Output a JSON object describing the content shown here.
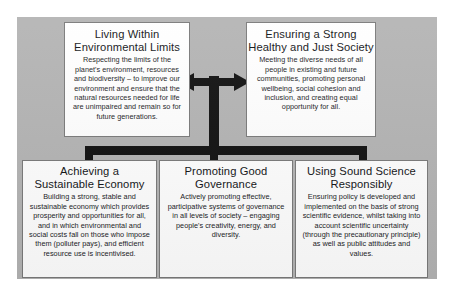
{
  "diagram": {
    "type": "hierarchy-diagram",
    "panel_color": "#b4b4b4",
    "box_fill": "#ffffff",
    "box_border": "#7a7a7a",
    "connector_color": "#111111"
  },
  "connector": {
    "double_arrow_label": "double-headed-horizontal-arrow",
    "trunk_label": "vertical-trunk",
    "distribution_bar_label": "horizontal-distribution-bar",
    "stems": 3
  },
  "top_row": [
    {
      "id": "environmental-limits",
      "title_lines": [
        "Living Within",
        "Environmental Limits"
      ],
      "title": "Living Within Environmental Limits",
      "body": "Respecting the limits of the planet's environment, resources and biodiversity – to improve our environment and ensure that the natural resources needed for life are unimpaired and remain so for future generations."
    },
    {
      "id": "just-society",
      "title_lines": [
        "Ensuring a Strong",
        "Healthy and Just Society"
      ],
      "title": "Ensuring a Strong Healthy and Just Society",
      "body": "Meeting the diverse needs of all people in existing and future communities, promoting personal wellbeing, social cohesion and inclusion, and creating equal opportunity for all."
    }
  ],
  "bottom_row": [
    {
      "id": "sustainable-economy",
      "title_lines": [
        "Achieving a",
        "Sustainable Economy"
      ],
      "title": "Achieving a Sustainable Economy",
      "body": "Building a strong, stable and sustainable economy which provides prosperity and opportunities for all, and in which environmental and social costs fall on those who impose them (polluter pays), and efficient resource use is incentivised."
    },
    {
      "id": "good-governance",
      "title_lines": [
        "Promoting Good",
        "Governance"
      ],
      "title": "Promoting Good Governance",
      "body": "Actively promoting effective, participative systems of governance in all levels of society – engaging people's creativity, energy, and diversity."
    },
    {
      "id": "sound-science",
      "title_lines": [
        "Using Sound Science",
        "Responsibly"
      ],
      "title": "Using Sound Science Responsibly",
      "body": "Ensuring policy is developed and implemented on the basis of strong scientific evidence, whilst taking into account scientific uncertainty (through the precautionary principle) as well as public attitudes and values."
    }
  ]
}
